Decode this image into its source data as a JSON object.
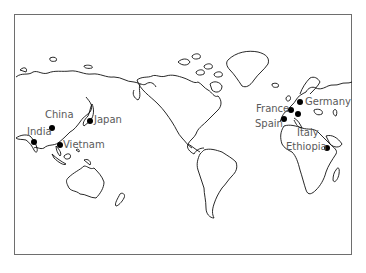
{
  "map": {
    "projection": "Pacific-centered world map (outline)",
    "frame_color": "#6e6e6e",
    "marker_color": "#000000",
    "label_color": "#5a5a5a",
    "markers": [
      {
        "name": "China",
        "dot": [
          52,
          128
        ],
        "label_pos": [
          45,
          110
        ]
      },
      {
        "name": "Japan",
        "dot": [
          90,
          121
        ],
        "label_pos": [
          94,
          115
        ]
      },
      {
        "name": "India",
        "dot": [
          34,
          142
        ],
        "label_pos": [
          27,
          127
        ]
      },
      {
        "name": "Vietnam",
        "dot": [
          60,
          145
        ],
        "label_pos": [
          63,
          140
        ]
      },
      {
        "name": "Germany",
        "dot": [
          300,
          102
        ],
        "label_pos": [
          305,
          97
        ]
      },
      {
        "name": "France",
        "dot": [
          291,
          110
        ],
        "label_pos": [
          256,
          104
        ]
      },
      {
        "name": "Spain",
        "dot": [
          284,
          119
        ],
        "label_pos": [
          255,
          119
        ]
      },
      {
        "name": "Italy",
        "dot": [
          298,
          114
        ],
        "label_pos": [
          297,
          128
        ]
      },
      {
        "name": "Ethiopia",
        "dot": [
          327,
          148
        ],
        "label_pos": [
          286,
          142
        ]
      }
    ]
  }
}
